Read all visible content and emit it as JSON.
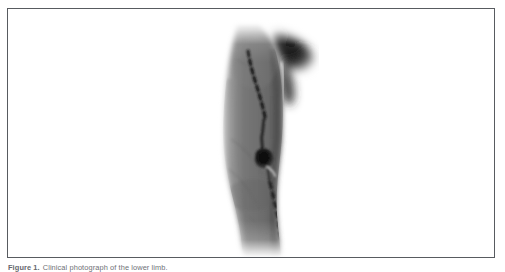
{
  "figure": {
    "frame_border_color": "#585b60",
    "background_color": "#ffffff",
    "caption_label": "Figure 1.",
    "caption_text": "Clinical photograph of the lower limb.",
    "photo": {
      "alt_description": "Grayscale clinical photograph of a lower limb shown in lateral view, with a dashed surgical marking line running down the length of the limb and a dark pigmented lesion at mid-limb",
      "modality": "clinical-photograph",
      "color_mode": "grayscale",
      "skin_tone_light": "#9a9a9a",
      "skin_tone_mid": "#7b7b7b",
      "skin_tone_dark": "#555555",
      "shadow_color": "#1a1a1a",
      "marking_line_color": "#1c1c1c",
      "lesion_color": "#161616",
      "annotations": {
        "marking_line": "dashed surgical marking line",
        "lesion": "dark pigmented lesion",
        "shadow_region": "dark background shadow, upper right"
      }
    }
  }
}
